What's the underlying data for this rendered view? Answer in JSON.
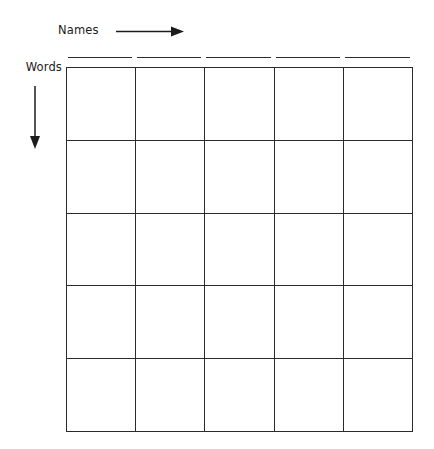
{
  "worksheet": {
    "background_color": "#ffffff",
    "line_color": "#2b2b2b",
    "text_color": "#1c1c1c",
    "column_axis": {
      "label": "Names",
      "arrow_icon": "arrow-right-icon",
      "direction": "right"
    },
    "row_axis": {
      "label": "Words",
      "arrow_icon": "arrow-down-icon",
      "direction": "down"
    },
    "name_blanks": [
      {
        "value": ""
      },
      {
        "value": ""
      },
      {
        "value": ""
      },
      {
        "value": ""
      },
      {
        "value": ""
      }
    ],
    "grid": {
      "columns": 5,
      "rows": 5,
      "cells": [
        [
          "",
          "",
          "",
          "",
          ""
        ],
        [
          "",
          "",
          "",
          "",
          ""
        ],
        [
          "",
          "",
          "",
          "",
          ""
        ],
        [
          "",
          "",
          "",
          "",
          ""
        ],
        [
          "",
          "",
          "",
          "",
          ""
        ]
      ]
    }
  }
}
